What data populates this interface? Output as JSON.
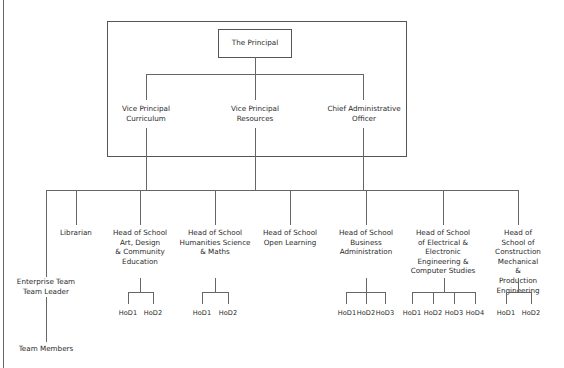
{
  "chart": {
    "title": "The Principal",
    "senior_team": [
      {
        "label": "Vice Principal\nCurriculum"
      },
      {
        "label": "Vice Principal\nResources"
      },
      {
        "label": "Chief Administrative\nOfficer"
      }
    ],
    "units": [
      {
        "label": "Enterprise Team\nTeam Leader",
        "sub": "Team Members"
      },
      {
        "label": "Librarian"
      },
      {
        "label": "Head of School\nArt, Design\n& Community\nEducation",
        "hods": [
          "HoD1",
          "HoD2"
        ]
      },
      {
        "label": "Head of School\nHumanities Science\n& Maths",
        "hods": [
          "HoD1",
          "HoD2"
        ]
      },
      {
        "label": "Head of School\nOpen Learning"
      },
      {
        "label": "Head of School\nBusiness\nAdministration",
        "hods": [
          "HoD1",
          "HoD2",
          "HoD3"
        ]
      },
      {
        "label": "Head of School\nof Electrical &\nElectronic\nEngineering &\nComputer Studies",
        "hods": [
          "HoD1",
          "HoD2",
          "HoD3",
          "HoD4"
        ]
      },
      {
        "label": "Head of School of\nConstruction\nMechanical\n& Production\nEngineering",
        "hods": [
          "HoD1",
          "HoD2"
        ]
      }
    ]
  }
}
